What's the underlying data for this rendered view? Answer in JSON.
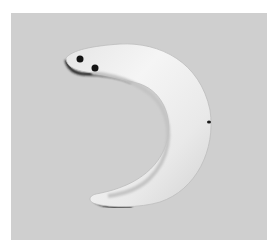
{
  "image": {
    "subject": "crescent-shaped pendant",
    "description": "Pale curved crescent ornament with two drilled holes at one end, photographed on a gray background",
    "colors": {
      "frame": "#ffffff",
      "background": "#cfcfcf",
      "object_light": "#f2f2f2",
      "object_mid": "#d9d9d9",
      "shadow": "#1e1e1e",
      "holes": "#141414"
    }
  }
}
